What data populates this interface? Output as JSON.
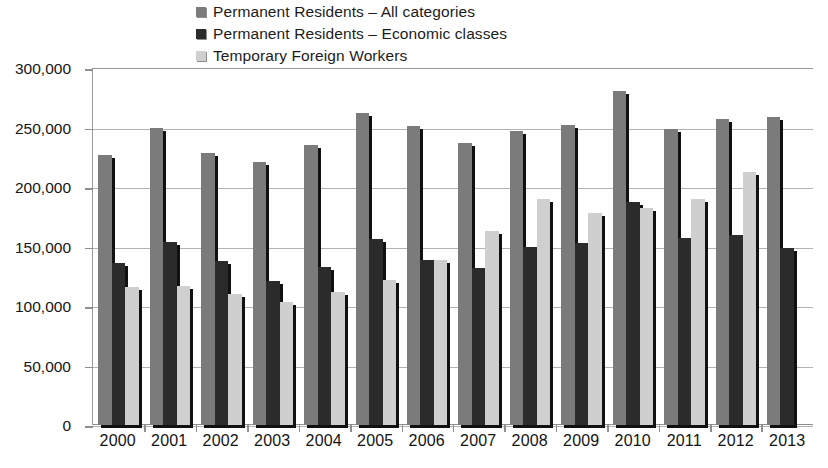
{
  "legend": {
    "position": "top-left",
    "items": [
      {
        "label": "Permanent Residents – All categories",
        "color": "#7b7b7b",
        "key": "all_categories"
      },
      {
        "label": "Permanent Residents – Economic classes",
        "color": "#2b2b2b",
        "key": "economic_classes"
      },
      {
        "label": "Temporary Foreign Workers",
        "color": "#cfcfcf",
        "key": "temporary_foreign_workers"
      }
    ]
  },
  "axes": {
    "y_ticks": [
      "300,000",
      "250,000",
      "200,000",
      "150,000",
      "100,000",
      "50,000",
      "0"
    ],
    "x_labels": [
      "2000",
      "2001",
      "2002",
      "2003",
      "2004",
      "2005",
      "2006",
      "2007",
      "2008",
      "2009",
      "2010",
      "2011",
      "2012",
      "2013"
    ]
  },
  "chart_data": {
    "type": "bar",
    "title": "",
    "subtitle": "",
    "xlabel": "",
    "ylabel": "",
    "ylim": [
      0,
      300000
    ],
    "ytick_step": 50000,
    "grid": true,
    "legend_position": "top-left",
    "categories": [
      "2000",
      "2001",
      "2002",
      "2003",
      "2004",
      "2005",
      "2006",
      "2007",
      "2008",
      "2009",
      "2010",
      "2011",
      "2012",
      "2013"
    ],
    "series": [
      {
        "name": "Permanent Residents – All categories",
        "color": "#7b7b7b",
        "values": [
          227000,
          250000,
          229000,
          221000,
          235000,
          262000,
          251000,
          237000,
          247000,
          252000,
          281000,
          249000,
          257000,
          259000
        ]
      },
      {
        "name": "Permanent Residents – Economic classes",
        "color": "#2b2b2b",
        "values": [
          136000,
          154000,
          138000,
          121000,
          133000,
          156000,
          139000,
          132000,
          150000,
          153000,
          187000,
          157000,
          160000,
          149000
        ]
      },
      {
        "name": "Temporary Foreign Workers",
        "color": "#cfcfcf",
        "values": [
          116000,
          117000,
          110000,
          103000,
          112000,
          122000,
          139000,
          163000,
          190000,
          178000,
          182000,
          190000,
          213000,
          0
        ]
      }
    ]
  }
}
